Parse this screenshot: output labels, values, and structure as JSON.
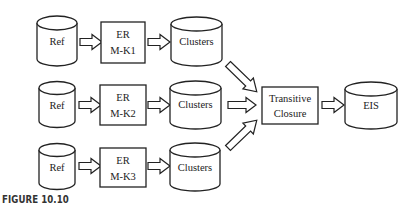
{
  "caption": "FIGURE 10.10",
  "colors": {
    "stroke": "#222222",
    "fill": "#ffffff",
    "text": "#222222"
  },
  "rows": [
    {
      "ref": {
        "label": "Ref"
      },
      "er": {
        "line1": "ER",
        "line2": "M-K1"
      },
      "clusters": {
        "label": "Clusters"
      }
    },
    {
      "ref": {
        "label": "Ref"
      },
      "er": {
        "line1": "ER",
        "line2": "M-K2"
      },
      "clusters": {
        "label": "Clusters"
      }
    },
    {
      "ref": {
        "label": "Ref"
      },
      "er": {
        "line1": "ER",
        "line2": "M-K3"
      },
      "clusters": {
        "label": "Clusters"
      }
    }
  ],
  "merge": {
    "line1": "Transitive",
    "line2": "Closure"
  },
  "output": {
    "label": "EIS"
  }
}
